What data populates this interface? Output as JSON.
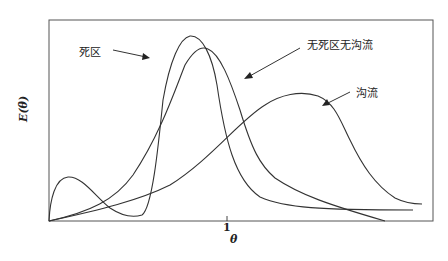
{
  "diagram": {
    "y_axis_label": "E(θ)",
    "x_axis_label": "θ",
    "x_tick_label": "1",
    "curves": [
      {
        "name": "dead-zone",
        "label": "死区"
      },
      {
        "name": "ideal",
        "label": "无死区无沟流"
      },
      {
        "name": "channeling",
        "label": "沟流"
      }
    ],
    "colors": {
      "line": "#333333",
      "background": "#ffffff"
    }
  }
}
